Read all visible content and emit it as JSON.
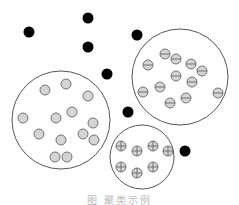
{
  "figure": {
    "caption": "图 聚类示例",
    "colors": {
      "outline": "#555555",
      "point_fill": "#d4d4d4",
      "point_stroke": "#666666",
      "outlier": "#000000",
      "background": "#ffffff"
    },
    "point_radius": 5,
    "outlier_radius": 5.5,
    "clusters": [
      {
        "name": "cluster-plain",
        "marker": "plain",
        "boundary": {
          "cx": 61,
          "cy": 120,
          "r": 49
        },
        "points": [
          [
            45,
            90
          ],
          [
            66,
            84
          ],
          [
            88,
            96
          ],
          [
            23,
            118
          ],
          [
            56,
            118
          ],
          [
            72,
            112
          ],
          [
            93,
            123
          ],
          [
            39,
            134
          ],
          [
            61,
            140
          ],
          [
            83,
            134
          ],
          [
            94,
            140
          ],
          [
            55,
            157
          ],
          [
            67,
            157
          ]
        ]
      },
      {
        "name": "cluster-minus",
        "marker": "minus",
        "boundary": {
          "cx": 180,
          "cy": 77,
          "r": 48
        },
        "points": [
          [
            165,
            54
          ],
          [
            176,
            59
          ],
          [
            148,
            65
          ],
          [
            191,
            64
          ],
          [
            202,
            71
          ],
          [
            176,
            76
          ],
          [
            192,
            82
          ],
          [
            160,
            87
          ],
          [
            143,
            92
          ],
          [
            218,
            93
          ],
          [
            186,
            98
          ],
          [
            170,
            103
          ]
        ]
      },
      {
        "name": "cluster-plus",
        "marker": "plus",
        "boundary": {
          "cx": 142,
          "cy": 157,
          "r": 32
        },
        "points": [
          [
            121,
            146
          ],
          [
            137,
            151
          ],
          [
            153,
            146
          ],
          [
            168,
            151
          ],
          [
            121,
            167
          ],
          [
            137,
            173
          ],
          [
            153,
            167
          ]
        ]
      }
    ],
    "outliers": [
      [
        29,
        32
      ],
      [
        88,
        18
      ],
      [
        88,
        47
      ],
      [
        137,
        35
      ],
      [
        107,
        74
      ],
      [
        128,
        112
      ],
      [
        185,
        151
      ]
    ]
  }
}
